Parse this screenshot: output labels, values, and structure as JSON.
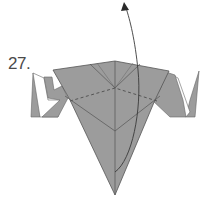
{
  "diagram": {
    "step_number": "27.",
    "colors": {
      "paper_colored": "#9c9c9c",
      "paper_white": "#ffffff",
      "line": "#555555",
      "arrow": "#3a3a3a"
    },
    "elements": [
      {
        "name": "main-body",
        "description": "central inverted kite-shaped model (colored side)"
      },
      {
        "name": "left-flap",
        "description": "left side flap with white inner layer"
      },
      {
        "name": "right-flap",
        "description": "right side flap with white inner layer"
      },
      {
        "name": "valley-fold-line",
        "description": "dashed valley fold across upper body"
      },
      {
        "name": "fold-arrow",
        "description": "curved arrow: fold bottom point up behind top"
      }
    ]
  }
}
